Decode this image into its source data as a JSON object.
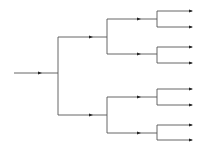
{
  "diagram": {
    "type": "binary-tree",
    "orientation": "left-to-right",
    "depth": 3,
    "leaf_count": 8,
    "line_color": "#555555",
    "arrow_color": "#222222",
    "root": {
      "x1": 14,
      "x2": 58,
      "y": 73,
      "arrow_x": 41
    },
    "levels": [
      {
        "split_x": 58,
        "end_x": 107,
        "arrow_x": 92,
        "branches": [
          {
            "y": 37
          },
          {
            "y": 115
          }
        ]
      },
      {
        "split_x": 107,
        "end_x": 157,
        "arrow_x": 140,
        "branches": [
          {
            "y": 19
          },
          {
            "y": 54
          },
          {
            "y": 97
          },
          {
            "y": 133
          }
        ]
      },
      {
        "split_x": 157,
        "end_x": 192,
        "arrow_x": 192,
        "branches": [
          {
            "y": 11
          },
          {
            "y": 27
          },
          {
            "y": 47
          },
          {
            "y": 63
          },
          {
            "y": 89
          },
          {
            "y": 105
          },
          {
            "y": 125
          },
          {
            "y": 140
          }
        ]
      }
    ]
  }
}
